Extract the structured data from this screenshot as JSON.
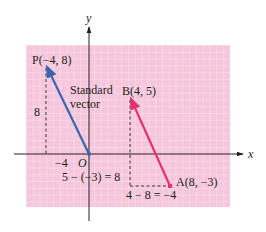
{
  "figure": {
    "background_color": "#ffffff",
    "grid_background_color": "#f6c6dc",
    "grid_line_color": "#fbe3ee",
    "axis_color": "#231f20",
    "axes": {
      "x_label": "x",
      "y_label": "y",
      "origin_label": "O",
      "tick_labels": [
        {
          "axis": "x",
          "value": -4,
          "text": "−4"
        },
        {
          "axis": "y",
          "value": 8,
          "text": "8"
        }
      ]
    },
    "points": [
      {
        "name": "P",
        "label": "P(−4, 8)",
        "x": -4,
        "y": 8
      },
      {
        "name": "B",
        "label": "B(4, 5)",
        "x": 4,
        "y": 5
      },
      {
        "name": "A",
        "label": "A(8, −3)",
        "x": 8,
        "y": -3
      },
      {
        "name": "O",
        "label": "O",
        "x": 0,
        "y": 0
      }
    ],
    "vectors": [
      {
        "name": "standard-vector",
        "from": "O",
        "to": "P",
        "color": "#3a66b0"
      },
      {
        "name": "vector-AB",
        "from": "A",
        "to": "B",
        "color": "#e2336e"
      }
    ],
    "annotations": {
      "standard_vector_line1": "Standard",
      "standard_vector_line2": "vector",
      "vertical_difference": "5 − (−3) = 8",
      "horizontal_difference": "4 − 8 = −4"
    }
  }
}
